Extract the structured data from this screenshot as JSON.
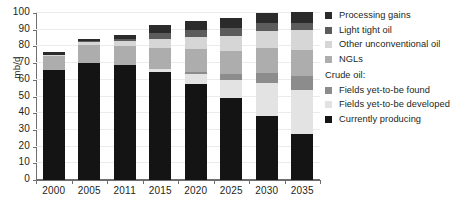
{
  "chart_data": {
    "type": "bar",
    "stacked": true,
    "title": "",
    "xlabel": "",
    "ylabel": "mb/d",
    "ylim": [
      0,
      100
    ],
    "ytick_step": 10,
    "yticks": [
      0,
      10,
      20,
      30,
      40,
      50,
      60,
      70,
      80,
      90,
      100
    ],
    "grid": true,
    "legend_position": "right",
    "categories": [
      "2000",
      "2005",
      "2011",
      "2015",
      "2020",
      "2025",
      "2030",
      "2035"
    ],
    "series": [
      {
        "name": "Currently producing",
        "color": "#141414",
        "values": [
          66.0,
          70.3,
          68.7,
          64.8,
          57.3,
          49.2,
          38.4,
          27.8
        ]
      },
      {
        "name": "Fields yet-to-be developed",
        "color": "#e3e3e3",
        "values": [
          0.0,
          0.0,
          0.0,
          1.8,
          6.2,
          10.4,
          19.6,
          26.2
        ]
      },
      {
        "name": "Fields yet-to-be found",
        "color": "#8c8c8c",
        "values": [
          0.0,
          0.0,
          0.0,
          0.0,
          1.3,
          3.6,
          6.0,
          8.0
        ]
      },
      {
        "name": "NGLs",
        "color": "#adadad",
        "values": [
          8.0,
          10.4,
          11.6,
          12.4,
          13.4,
          14.2,
          15.0,
          15.8
        ]
      },
      {
        "name": "Other unconventional oil",
        "color": "#d6d6d6",
        "values": [
          0.8,
          1.9,
          3.2,
          5.6,
          7.2,
          9.0,
          10.4,
          12.2
        ]
      },
      {
        "name": "Light tight oil",
        "color": "#5c5c5c",
        "values": [
          0.0,
          0.5,
          1.1,
          3.2,
          4.4,
          4.8,
          4.6,
          4.2
        ]
      },
      {
        "name": "Processing gains",
        "color": "#2b2b2b",
        "values": [
          1.7,
          1.2,
          2.2,
          4.8,
          5.2,
          5.8,
          5.8,
          6.2
        ]
      }
    ],
    "totals": [
      76.5,
      84.3,
      86.8,
      92.6,
      95.0,
      97.0,
      99.8,
      100.4
    ],
    "legend_entries": [
      {
        "label": "Processing gains",
        "color": "#2b2b2b",
        "type": "item"
      },
      {
        "label": "Light tight oil",
        "color": "#5c5c5c",
        "type": "item"
      },
      {
        "label": "Other unconventional oil",
        "color": "#d6d6d6",
        "type": "item"
      },
      {
        "label": "NGLs",
        "color": "#adadad",
        "type": "item"
      },
      {
        "label": "Crude oil:",
        "color": "",
        "type": "group"
      },
      {
        "label": "Fields yet-to-be found",
        "color": "#8c8c8c",
        "type": "item"
      },
      {
        "label": "Fields yet-to-be developed",
        "color": "#e3e3e3",
        "type": "item"
      },
      {
        "label": "Currently producing",
        "color": "#141414",
        "type": "item"
      }
    ]
  },
  "axis": {
    "y_title": "mb/d"
  }
}
